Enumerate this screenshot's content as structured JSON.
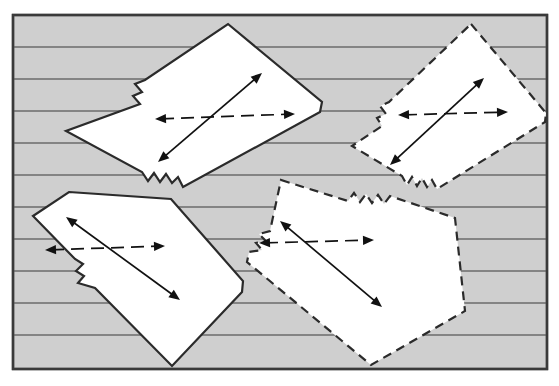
{
  "figure": {
    "canvas": {
      "width": 559,
      "height": 386
    },
    "colors": {
      "page_background": "#ffffff",
      "panel_fill": "#cfcfcf",
      "panel_stroke": "#3a3a3a",
      "hatch_line": "#6b6b6b",
      "block_fill": "#ffffff",
      "block_stroke": "#2b2b2b",
      "arrow": "#111111"
    },
    "frame": {
      "x": 13,
      "y": 15,
      "width": 534,
      "height": 354,
      "stroke_width": 2.4
    },
    "hatching": {
      "orientation": "horizontal",
      "count": 10,
      "y_positions": [
        47,
        79,
        111,
        143,
        175,
        207,
        239,
        271,
        303,
        335
      ],
      "stroke_width": 1.5
    },
    "blocks": [
      {
        "id": "block-top-left",
        "label": "Top left block",
        "outline": "solid",
        "outline_dash": "none",
        "points": "228,24 322,102 320,112 183,187 178,177 172,183 166,174 160,182 154,173 148,181 142,172 66,131 140,104 133,96 142,92 135,84 145,80",
        "horizontal_arrow": {
          "x1": 155,
          "y1": 119,
          "x2": 295,
          "y2": 114,
          "style": "dashed",
          "heads": "both"
        },
        "diagonal_arrow": {
          "x1": 158,
          "y1": 162,
          "x2": 262,
          "y2": 73,
          "style": "solid",
          "heads": "both"
        }
      },
      {
        "id": "block-top-right",
        "label": "Top right block",
        "outline": "dashed",
        "outline_dash": "9 6",
        "points": "471,24 546,113 545,122 437,189 432,180 427,187 422,178 417,186 412,177 407,185 402,176 352,146 382,126 377,118 386,114 380,106 389,102",
        "horizontal_arrow": {
          "x1": 398,
          "y1": 115,
          "x2": 508,
          "y2": 112,
          "style": "dashed",
          "heads": "both"
        },
        "diagonal_arrow": {
          "x1": 390,
          "y1": 165,
          "x2": 484,
          "y2": 78,
          "style": "solid",
          "heads": "both"
        }
      },
      {
        "id": "block-bottom-left",
        "label": "Bottom left block",
        "outline": "solid",
        "outline_dash": "none",
        "points": "69,192 171,199 243,281 242,292 172,366 95,288 78,283 84,276 76,271 83,264 75,259 33,216",
        "horizontal_arrow": {
          "x1": 45,
          "y1": 250,
          "x2": 165,
          "y2": 246,
          "style": "dashed",
          "heads": "both"
        },
        "diagonal_arrow": {
          "x1": 66,
          "y1": 217,
          "x2": 180,
          "y2": 300,
          "style": "solid",
          "heads": "both"
        }
      },
      {
        "id": "block-bottom-right",
        "label": "Bottom right block",
        "outline": "dashed",
        "outline_dash": "9 6",
        "points": "281,180 348,201 354,193 360,202 366,194 372,203 378,195 384,204 390,196 455,218 465,311 371,365 247,262 249,252 262,250 256,243 266,241 259,234 270,231",
        "horizontal_arrow": {
          "x1": 259,
          "y1": 243,
          "x2": 374,
          "y2": 240,
          "style": "dashed",
          "heads": "both"
        },
        "diagonal_arrow": {
          "x1": 280,
          "y1": 221,
          "x2": 382,
          "y2": 307,
          "style": "solid",
          "heads": "both"
        }
      }
    ],
    "legend": {
      "solid_outline_meaning": "solid outline block",
      "dashed_outline_meaning": "dashed outline block",
      "dashed_arrow_meaning": "extension direction",
      "solid_arrow_meaning": "elongation direction"
    }
  }
}
